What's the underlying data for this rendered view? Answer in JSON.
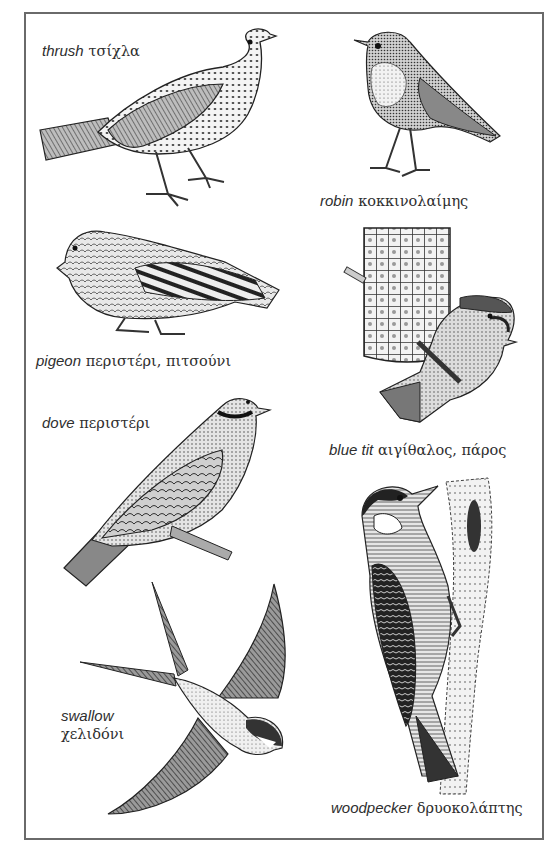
{
  "page": {
    "type": "illustrated vocabulary page",
    "topic": "birds"
  },
  "birds": [
    {
      "id": "thrush",
      "english": "thrush",
      "greek": "τσίχλα"
    },
    {
      "id": "robin",
      "english": "robin",
      "greek": "κοκκινολαίμης"
    },
    {
      "id": "pigeon",
      "english": "pigeon",
      "greek": "περιστέρι, πιτσούνι"
    },
    {
      "id": "blue_tit",
      "english": "blue tit",
      "greek": "αιγίθαλος, πάρος"
    },
    {
      "id": "dove",
      "english": "dove",
      "greek": "περιστέρι"
    },
    {
      "id": "swallow",
      "english": "swallow",
      "greek": "χελιδόνι"
    },
    {
      "id": "woodpecker",
      "english": "woodpecker",
      "greek": "δρυοκολάπτης"
    }
  ],
  "colors": {
    "ink": "#2a2a2a",
    "frame": "#6a6a6a",
    "background": "#ffffff"
  }
}
